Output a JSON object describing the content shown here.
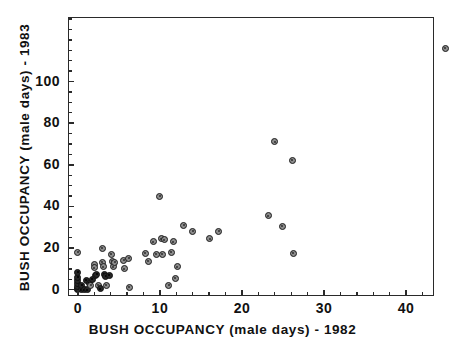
{
  "chart_data": {
    "type": "scatter",
    "title": "",
    "xlabel": "BUSH OCCUPANCY (male days)  -  1982",
    "ylabel": "BUSH OCCUPANCY (male days)  -  1983",
    "xlim": [
      -1.2,
      43.4
    ],
    "ylim": [
      -3,
      131
    ],
    "xticks": [
      0,
      10,
      20,
      30,
      40
    ],
    "yticks": [
      0,
      20,
      40,
      60,
      80,
      100
    ],
    "xtick_labels": [
      "0",
      "10",
      "20",
      "30",
      "40"
    ],
    "ytick_labels": [
      "0",
      "20",
      "40",
      "60",
      "80",
      "100"
    ],
    "grid": false,
    "legend": null,
    "marker": "filled-circle-outlined",
    "marker_color": "#8c8c8c",
    "marker_edge_color": "#1c1c1c",
    "points": [
      {
        "x": 0.0,
        "y": 0.0,
        "dark": true
      },
      {
        "x": 0.0,
        "y": 0.5,
        "dark": true
      },
      {
        "x": 0.0,
        "y": 1.5,
        "dark": true
      },
      {
        "x": 0.0,
        "y": 3.0,
        "dark": true
      },
      {
        "x": 0.0,
        "y": 4.5,
        "dark": true
      },
      {
        "x": 0.0,
        "y": 6.0,
        "dark": true
      },
      {
        "x": 0.0,
        "y": 8.5,
        "dark": true
      },
      {
        "x": 0.0,
        "y": 18.0,
        "dark": false
      },
      {
        "x": 0.4,
        "y": 0.0,
        "dark": true
      },
      {
        "x": 0.5,
        "y": 2.0,
        "dark": true
      },
      {
        "x": 0.8,
        "y": 0.0,
        "dark": true
      },
      {
        "x": 1.0,
        "y": 4.5,
        "dark": true
      },
      {
        "x": 1.2,
        "y": 0.0,
        "dark": true
      },
      {
        "x": 1.4,
        "y": 3.0,
        "dark": true
      },
      {
        "x": 1.6,
        "y": 2.0,
        "dark": false
      },
      {
        "x": 1.8,
        "y": 5.0,
        "dark": true
      },
      {
        "x": 2.0,
        "y": 12.0,
        "dark": false
      },
      {
        "x": 2.0,
        "y": 10.5,
        "dark": false
      },
      {
        "x": 2.1,
        "y": 7.0,
        "dark": true
      },
      {
        "x": 2.3,
        "y": 7.5,
        "dark": true
      },
      {
        "x": 2.5,
        "y": 2.0,
        "dark": false
      },
      {
        "x": 2.7,
        "y": 0.5,
        "dark": true
      },
      {
        "x": 3.0,
        "y": 20.0,
        "dark": false
      },
      {
        "x": 3.0,
        "y": 13.0,
        "dark": false
      },
      {
        "x": 3.1,
        "y": 11.0,
        "dark": false
      },
      {
        "x": 3.2,
        "y": 7.5,
        "dark": true
      },
      {
        "x": 3.4,
        "y": 6.5,
        "dark": true
      },
      {
        "x": 3.5,
        "y": 2.0,
        "dark": false
      },
      {
        "x": 3.8,
        "y": 7.0,
        "dark": true
      },
      {
        "x": 4.1,
        "y": 17.0,
        "dark": false
      },
      {
        "x": 4.2,
        "y": 13.5,
        "dark": false
      },
      {
        "x": 4.3,
        "y": 11.0,
        "dark": false
      },
      {
        "x": 4.5,
        "y": 13.0,
        "dark": false
      },
      {
        "x": 5.6,
        "y": 14.0,
        "dark": false
      },
      {
        "x": 5.7,
        "y": 10.0,
        "dark": false
      },
      {
        "x": 6.2,
        "y": 15.0,
        "dark": false
      },
      {
        "x": 6.3,
        "y": 1.0,
        "dark": false
      },
      {
        "x": 8.2,
        "y": 17.5,
        "dark": false
      },
      {
        "x": 8.6,
        "y": 13.5,
        "dark": false
      },
      {
        "x": 9.2,
        "y": 23.0,
        "dark": false
      },
      {
        "x": 9.6,
        "y": 17.0,
        "dark": false
      },
      {
        "x": 10.0,
        "y": 45.0,
        "dark": false
      },
      {
        "x": 10.2,
        "y": 24.5,
        "dark": false
      },
      {
        "x": 10.5,
        "y": 24.0,
        "dark": false
      },
      {
        "x": 10.3,
        "y": 17.0,
        "dark": false
      },
      {
        "x": 11.1,
        "y": 2.0,
        "dark": false
      },
      {
        "x": 11.6,
        "y": 23.0,
        "dark": false
      },
      {
        "x": 11.4,
        "y": 18.0,
        "dark": false
      },
      {
        "x": 11.9,
        "y": 5.5,
        "dark": false
      },
      {
        "x": 12.1,
        "y": 11.0,
        "dark": false
      },
      {
        "x": 12.9,
        "y": 31.0,
        "dark": false
      },
      {
        "x": 14.0,
        "y": 28.0,
        "dark": false
      },
      {
        "x": 16.1,
        "y": 24.5,
        "dark": false
      },
      {
        "x": 17.2,
        "y": 28.0,
        "dark": false
      },
      {
        "x": 23.2,
        "y": 35.5,
        "dark": false
      },
      {
        "x": 24.0,
        "y": 71.0,
        "dark": false
      },
      {
        "x": 24.9,
        "y": 30.5,
        "dark": false
      },
      {
        "x": 26.1,
        "y": 62.0,
        "dark": false
      },
      {
        "x": 26.3,
        "y": 17.5,
        "dark": false
      },
      {
        "x": 44.8,
        "y": 116.0,
        "dark": false
      }
    ]
  },
  "axes": {
    "x_title": "BUSH OCCUPANCY (male days)  -  1982",
    "y_title": "BUSH OCCUPANCY (male days)  -  1983"
  }
}
